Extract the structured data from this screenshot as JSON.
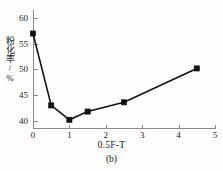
{
  "chart_data": {
    "type": "line",
    "title": "",
    "subtitle": "",
    "xlabel": "0.5F-T",
    "ylabel": "粉化率/%",
    "caption": "(b)",
    "x": [
      0,
      0.5,
      1.0,
      1.5,
      2.5,
      4.5
    ],
    "values": [
      57.0,
      43.0,
      40.2,
      41.8,
      43.6,
      50.2
    ],
    "series": [
      {
        "name": "粉化率",
        "x": [
          0,
          0.5,
          1.0,
          1.5,
          2.5,
          4.5
        ],
        "values": [
          57.0,
          43.0,
          40.2,
          41.8,
          43.6,
          50.2
        ]
      }
    ],
    "xlim": [
      0,
      5
    ],
    "ylim": [
      38.6,
      60.8
    ],
    "xticks": [
      0,
      1,
      2,
      3,
      4,
      5
    ],
    "yticks": [
      40,
      45,
      50,
      55,
      60
    ],
    "xtick_labels": [
      "0",
      "1",
      "2",
      "3",
      "4",
      "5"
    ],
    "ytick_labels": [
      "40",
      "45",
      "50",
      "55",
      "60"
    ],
    "grid": false,
    "legend": false,
    "legend_position": "none",
    "marker": "square",
    "line_color": "#111111",
    "marker_color": "#111111",
    "axis_color": "#8a8a8a",
    "background_color": "#fdfdfd"
  }
}
